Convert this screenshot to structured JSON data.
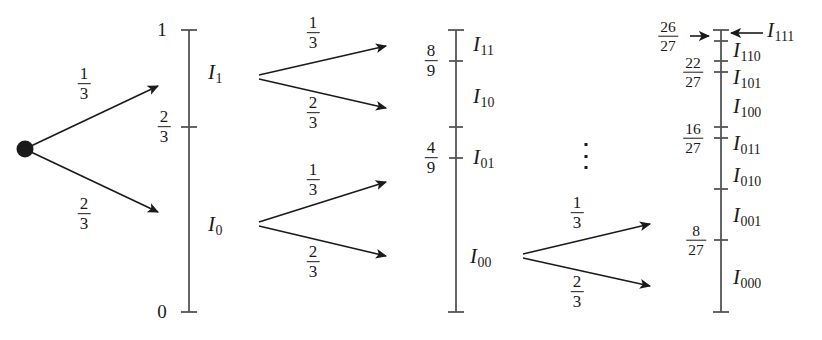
{
  "figure": {
    "ink_color": "#1a1a1a",
    "axis_color": "#555555"
  },
  "branch_labels": {
    "one_third": {
      "num": "1",
      "den": "3"
    },
    "two_thirds": {
      "num": "2",
      "den": "3"
    }
  },
  "level1": {
    "axis": {
      "top_label": "1",
      "bottom_label": "0"
    },
    "ticks": [
      {
        "label_num": "2",
        "label_den": "3"
      }
    ],
    "intervals": [
      {
        "base": "I",
        "sub": "1"
      },
      {
        "base": "I",
        "sub": "0"
      }
    ],
    "branches": [
      {
        "prob_num": "1",
        "prob_den": "3"
      },
      {
        "prob_num": "2",
        "prob_den": "3"
      }
    ]
  },
  "level2": {
    "ticks": [
      {
        "label_num": "8",
        "label_den": "9"
      },
      {
        "label_num": "4",
        "label_den": "9"
      }
    ],
    "intervals": [
      {
        "base": "I",
        "sub": "11"
      },
      {
        "base": "I",
        "sub": "10"
      },
      {
        "base": "I",
        "sub": "01"
      },
      {
        "base": "I",
        "sub": "00"
      }
    ],
    "branches_upper": [
      {
        "prob_num": "1",
        "prob_den": "3"
      },
      {
        "prob_num": "2",
        "prob_den": "3"
      }
    ],
    "branches_lower": [
      {
        "prob_num": "1",
        "prob_den": "3"
      },
      {
        "prob_num": "2",
        "prob_den": "3"
      }
    ]
  },
  "level3": {
    "ticks": [
      {
        "label_num": "26",
        "label_den": "27"
      },
      {
        "label_num": "22",
        "label_den": "27"
      },
      {
        "label_num": "16",
        "label_den": "27"
      },
      {
        "label_num": "8",
        "label_den": "27"
      }
    ],
    "intervals": [
      {
        "base": "I",
        "sub": "111"
      },
      {
        "base": "I",
        "sub": "110"
      },
      {
        "base": "I",
        "sub": "101"
      },
      {
        "base": "I",
        "sub": "100"
      },
      {
        "base": "I",
        "sub": "011"
      },
      {
        "base": "I",
        "sub": "010"
      },
      {
        "base": "I",
        "sub": "001"
      },
      {
        "base": "I",
        "sub": "000"
      }
    ],
    "branches": [
      {
        "prob_num": "1",
        "prob_den": "3"
      },
      {
        "prob_num": "2",
        "prob_den": "3"
      }
    ],
    "ellipsis": "vertical-ellipsis"
  }
}
